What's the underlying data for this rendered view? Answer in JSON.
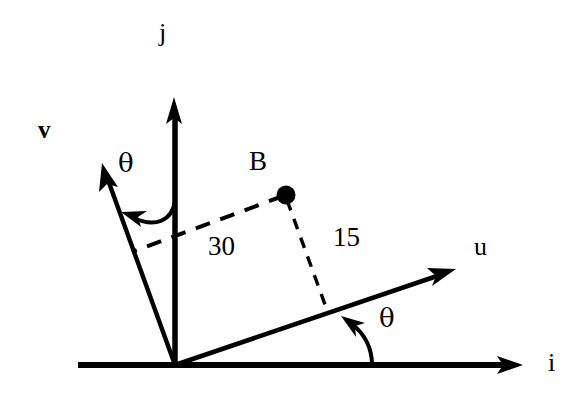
{
  "figure": {
    "type": "vector-coordinate-diagram",
    "background_color": "#ffffff",
    "stroke_color": "#000000"
  },
  "axes": {
    "i": {
      "label": "i",
      "kind": "horizontal-axis-arrow",
      "label_x": 548,
      "label_y": 350
    },
    "j": {
      "label": "j",
      "kind": "vertical-axis-arrow",
      "label_x": 159,
      "label_y": 20
    }
  },
  "vectors": {
    "u": {
      "label": "u",
      "kind": "rotated-axis-arrow",
      "label_x": 474,
      "label_y": 234
    },
    "v": {
      "label": "v",
      "kind": "rotated-axis-arrow",
      "label_x": 38,
      "label_y": 117
    }
  },
  "point": {
    "label": "B",
    "label_x": 249,
    "label_y": 148,
    "dot_x": 286,
    "dot_y": 195,
    "dot_radius": 9
  },
  "dimensions": [
    {
      "name": "u-component",
      "value": "30",
      "label_x": 208,
      "label_y": 233,
      "style": "dashed",
      "from": "point-B",
      "to": "v-axis"
    },
    {
      "name": "v-component",
      "value": "15",
      "label_x": 333,
      "label_y": 224,
      "style": "dashed",
      "from": "point-B",
      "to": "u-axis"
    }
  ],
  "angles": [
    {
      "name": "theta-between-j-and-v",
      "label": "θ",
      "label_x": 118,
      "label_y": 150,
      "arc": "from j axis to v vector"
    },
    {
      "name": "theta-between-i-and-u",
      "label": "θ",
      "label_x": 379,
      "label_y": 305,
      "arc": "from i axis to u vector"
    }
  ],
  "geometry": {
    "origin": {
      "x": 175,
      "y": 365
    },
    "i_axis": {
      "x1": 78,
      "y1": 365,
      "x2": 523,
      "y2": 365
    },
    "j_axis": {
      "x1": 175,
      "y1": 365,
      "x2": 175,
      "y2": 97
    },
    "u_vector": {
      "x1": 175,
      "y1": 365,
      "x2": 455,
      "y2": 270
    },
    "v_vector": {
      "x1": 175,
      "y1": 365,
      "x2": 102,
      "y2": 164
    },
    "dash_30": {
      "x1": 286,
      "y1": 195,
      "x2": 132,
      "y2": 252
    },
    "dash_15": {
      "x1": 286,
      "y1": 195,
      "x2": 327,
      "y2": 309
    }
  }
}
